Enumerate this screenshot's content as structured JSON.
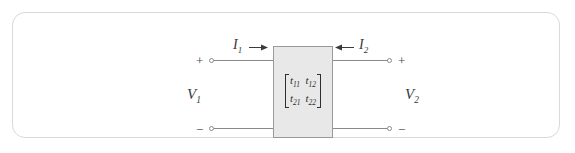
{
  "diagram": {
    "colors": {
      "frame_border": "#d9d9d9",
      "box_fill": "#e8e8e8",
      "box_border": "#9a9a9a",
      "wire": "#8a8a8a",
      "text": "#3a3a3a"
    },
    "box": {
      "matrix": {
        "rows": [
          [
            {
              "symbol": "t",
              "sub": "11"
            },
            {
              "symbol": "t",
              "sub": "12"
            }
          ],
          [
            {
              "symbol": "t",
              "sub": "21"
            },
            {
              "symbol": "t",
              "sub": "22"
            }
          ]
        ]
      }
    },
    "ports": {
      "left": {
        "voltage": {
          "symbol": "V",
          "sub": "1"
        },
        "current": {
          "symbol": "I",
          "sub": "1"
        },
        "current_arrow": "arrow-right-icon",
        "plus_sign": "+",
        "minus_sign": "−"
      },
      "right": {
        "voltage": {
          "symbol": "V",
          "sub": "2"
        },
        "current": {
          "symbol": "I",
          "sub": "2"
        },
        "current_arrow": "arrow-left-icon",
        "plus_sign": "+",
        "minus_sign": "−"
      }
    }
  }
}
